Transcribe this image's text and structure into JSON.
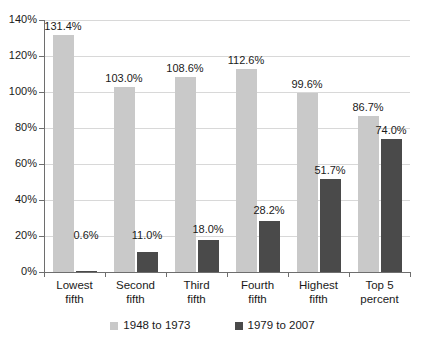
{
  "chart_data": {
    "type": "bar",
    "title": "",
    "xlabel": "",
    "ylabel": "",
    "ylim": [
      0,
      140
    ],
    "ytick_labels": [
      "0%",
      "20%",
      "40%",
      "60%",
      "80%",
      "100%",
      "120%",
      "140%"
    ],
    "ytick_values": [
      0,
      20,
      40,
      60,
      80,
      100,
      120,
      140
    ],
    "grid": true,
    "legend_position": "bottom",
    "categories": [
      "Lowest fifth",
      "Second fifth",
      "Third fifth",
      "Fourth fifth",
      "Highest fifth",
      "Top 5 percent"
    ],
    "category_lines": [
      [
        "Lowest",
        "fifth"
      ],
      [
        "Second",
        "fifth"
      ],
      [
        "Third",
        "fifth"
      ],
      [
        "Fourth",
        "fifth"
      ],
      [
        "Highest",
        "fifth"
      ],
      [
        "Top 5",
        "percent"
      ]
    ],
    "series": [
      {
        "name": "1948 to 1973",
        "color": "#c9c9c9",
        "values": [
          131.4,
          103.0,
          108.6,
          112.6,
          99.6,
          86.7
        ],
        "labels": [
          "131.4%",
          "103.0%",
          "108.6%",
          "112.6%",
          "99.6%",
          "86.7%"
        ]
      },
      {
        "name": "1979 to 2007",
        "color": "#4a4a4a",
        "values": [
          0.6,
          11.0,
          18.0,
          28.2,
          51.7,
          74.0
        ],
        "labels": [
          "0.6%",
          "11.0%",
          "18.0%",
          "28.2%",
          "51.7%",
          "74.0%"
        ]
      }
    ]
  },
  "legend": {
    "items": [
      {
        "label": "1948 to 1973",
        "swatch": "light-gray-swatch"
      },
      {
        "label": "1979 to 2007",
        "swatch": "dark-gray-swatch"
      }
    ]
  }
}
